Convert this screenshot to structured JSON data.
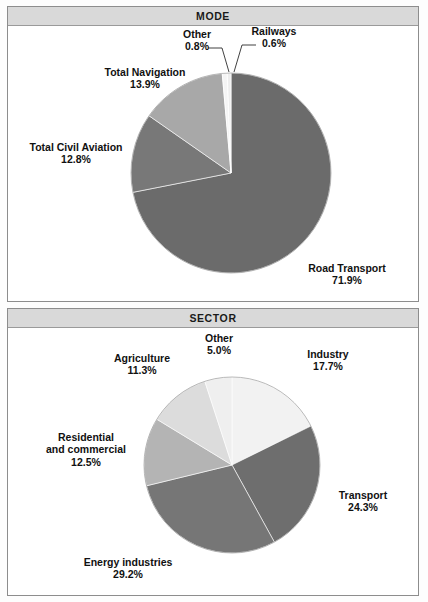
{
  "panels": [
    {
      "id": "mode",
      "title": "MODE"
    },
    {
      "id": "sector",
      "title": "SECTOR"
    }
  ],
  "chart_data": [
    {
      "type": "pie",
      "title": "MODE",
      "categories": [
        "Road Transport",
        "Total Civil Aviation",
        "Total Navigation",
        "Other",
        "Railways"
      ],
      "values": [
        71.9,
        12.8,
        13.9,
        0.8,
        0.6
      ],
      "value_suffix": "%",
      "labels": [
        {
          "name": "Road Transport",
          "value": "71.9%",
          "color": "#6b6b6b"
        },
        {
          "name": "Total Civil Aviation",
          "value": "12.8%",
          "color": "#787878"
        },
        {
          "name": "Total Navigation",
          "value": "13.9%",
          "color": "#a8a8a8"
        },
        {
          "name": "Other",
          "value": "0.8%",
          "color": "#f4f4f4"
        },
        {
          "name": "Railways",
          "value": "0.6%",
          "color": "#ededed"
        }
      ],
      "start_angle_deg": 0,
      "direction": "clockwise",
      "legend": "none",
      "grid": false
    },
    {
      "type": "pie",
      "title": "SECTOR",
      "categories": [
        "Industry",
        "Transport",
        "Energy industries",
        "Residential and commercial",
        "Agriculture",
        "Other"
      ],
      "values": [
        17.7,
        24.3,
        29.2,
        12.5,
        11.3,
        5.0
      ],
      "value_suffix": "%",
      "labels": [
        {
          "name": "Industry",
          "value": "17.7%",
          "color": "#f2f2f2"
        },
        {
          "name": "Transport",
          "value": "24.3%",
          "color": "#6e6e6e"
        },
        {
          "name": "Energy industries",
          "value": "29.2%",
          "color": "#767676"
        },
        {
          "name": "Residential and commercial",
          "value": "12.5%",
          "color": "#b4b4b4"
        },
        {
          "name": "Agriculture",
          "value": "11.3%",
          "color": "#dcdcdc"
        },
        {
          "name": "Other",
          "value": "5.0%",
          "color": "#efefef"
        }
      ],
      "start_angle_deg": 0,
      "direction": "clockwise",
      "legend": "none",
      "grid": false
    }
  ],
  "mode_labels": {
    "other": {
      "name": "Other",
      "value": "0.8%"
    },
    "railways": {
      "name": "Railways",
      "value": "0.6%"
    },
    "navigation": {
      "name": "Total Navigation",
      "value": "13.9%"
    },
    "aviation": {
      "name": "Total Civil Aviation",
      "value": "12.8%"
    },
    "road": {
      "name": "Road Transport",
      "value": "71.9%"
    }
  },
  "sector_labels": {
    "other": {
      "name": "Other",
      "value": "5.0%"
    },
    "industry": {
      "name": "Industry",
      "value": "17.7%"
    },
    "agriculture": {
      "name": "Agriculture",
      "value": "11.3%"
    },
    "residential": {
      "name": "Residential",
      "name2": "and commercial",
      "value": "12.5%"
    },
    "transport": {
      "name": "Transport",
      "value": "24.3%"
    },
    "energy": {
      "name": "Energy industries",
      "value": "29.2%"
    }
  }
}
